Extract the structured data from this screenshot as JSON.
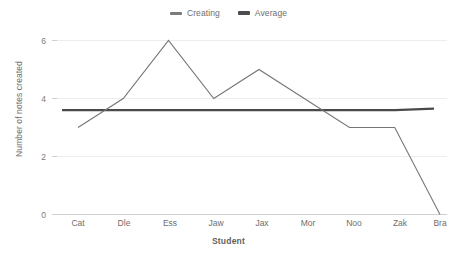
{
  "chart_data": {
    "type": "line",
    "title": "",
    "xlabel": "Student",
    "ylabel": "Number of notes created",
    "categories": [
      "Cat",
      "Dle",
      "Ess",
      "Jaw",
      "Jax",
      "Mor",
      "Noo",
      "Zak",
      "Bra"
    ],
    "series": [
      {
        "name": "Creating",
        "values": [
          3,
          4,
          6,
          4,
          5,
          4,
          3,
          3,
          0
        ],
        "color": "#767676"
      },
      {
        "name": "Average",
        "values": [
          3.6,
          3.6,
          3.6,
          3.6,
          3.6,
          3.6,
          3.6,
          3.6,
          3.65
        ],
        "color": "#4a4a4a"
      }
    ],
    "ylim": [
      0,
      6
    ],
    "yticks": [
      0,
      2,
      4,
      6
    ],
    "ytick_labels": [
      "0",
      "2",
      "4",
      "6"
    ],
    "grid": true,
    "legend_position": "top-center"
  },
  "legend": {
    "entries": [
      {
        "label": "Creating"
      },
      {
        "label": "Average"
      }
    ]
  },
  "axes": {
    "y_title": "Number of notes created",
    "x_title": "Student",
    "y_tick_0": "0",
    "y_tick_1": "2",
    "y_tick_2": "4",
    "y_tick_3": "6",
    "x_cat_0": "Cat",
    "x_cat_1": "Dle",
    "x_cat_2": "Ess",
    "x_cat_3": "Jaw",
    "x_cat_4": "Jax",
    "x_cat_5": "Mor",
    "x_cat_6": "Noo",
    "x_cat_7": "Zak",
    "x_cat_8": "Bra"
  },
  "colors": {
    "creating": "#767676",
    "average": "#4a4a4a",
    "grid": "#ededed",
    "axis": "#cfcfcf",
    "text": "#6e6e6e",
    "background": "#ffffff"
  }
}
